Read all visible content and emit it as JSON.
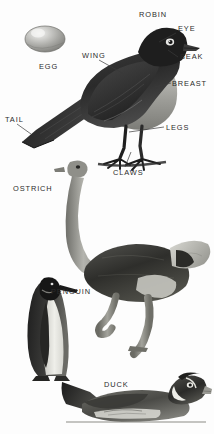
{
  "plate": {
    "title": "Birds",
    "background": "#fdfdfd",
    "ink": "#2b2b2b",
    "width": 214,
    "height": 434
  },
  "labels": [
    {
      "id": "robin",
      "text": "ROBIN",
      "x": 139,
      "y": 11
    },
    {
      "id": "eye",
      "text": "EYE",
      "x": 178,
      "y": 27
    },
    {
      "id": "egg",
      "text": "EGG",
      "x": 39,
      "y": 64
    },
    {
      "id": "wing",
      "text": "WING",
      "x": 82,
      "y": 54
    },
    {
      "id": "beak",
      "text": "BEAK",
      "x": 180,
      "y": 59
    },
    {
      "id": "breast",
      "text": "BREAST",
      "x": 173,
      "y": 85
    },
    {
      "id": "tail",
      "text": "TAIL",
      "x": 5,
      "y": 117
    },
    {
      "id": "legs",
      "text": "LEGS",
      "x": 166,
      "y": 127
    },
    {
      "id": "claws",
      "text": "CLAWS",
      "x": 114,
      "y": 172
    },
    {
      "id": "ostrich",
      "text": "OSTRICH",
      "x": 13,
      "y": 186
    },
    {
      "id": "penguin",
      "text": "PENGUIN",
      "x": 51,
      "y": 289
    },
    {
      "id": "duck",
      "text": "DUCK",
      "x": 104,
      "y": 383
    }
  ],
  "leader_lines": [
    {
      "id": "leader-eye",
      "x1": 176,
      "y1": 33,
      "x2": 159,
      "y2": 42
    },
    {
      "id": "leader-beak",
      "x1": 178,
      "y1": 59,
      "x2": 168,
      "y2": 52
    },
    {
      "id": "leader-breast",
      "x1": 171,
      "y1": 85,
      "x2": 155,
      "y2": 88
    },
    {
      "id": "leader-wing",
      "x1": 98,
      "y1": 60,
      "x2": 123,
      "y2": 74
    },
    {
      "id": "leader-tail",
      "x1": 16,
      "y1": 124,
      "x2": 30,
      "y2": 134
    },
    {
      "id": "leader-legs",
      "x1": 164,
      "y1": 128,
      "x2": 129,
      "y2": 133
    },
    {
      "id": "leader-claws",
      "x1": 125,
      "y1": 168,
      "x2": 131,
      "y2": 152
    }
  ],
  "figures": [
    {
      "id": "egg-figure",
      "name": "egg",
      "caption": "EGG"
    },
    {
      "id": "robin-figure",
      "name": "robin",
      "caption": "ROBIN"
    },
    {
      "id": "ostrich-figure",
      "name": "ostrich",
      "caption": "OSTRICH"
    },
    {
      "id": "penguin-figure",
      "name": "penguin",
      "caption": "PENGUIN"
    },
    {
      "id": "duck-figure",
      "name": "duck",
      "caption": "DUCK"
    }
  ],
  "parts_labeled": [
    "EYE",
    "BEAK",
    "BREAST",
    "WING",
    "TAIL",
    "LEGS",
    "CLAWS"
  ]
}
